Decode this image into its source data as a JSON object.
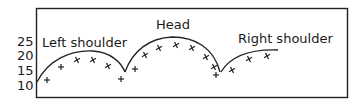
{
  "chart_data": {
    "type": "line",
    "title": "",
    "xlabel": "",
    "ylabel": "",
    "ylim": [
      10,
      25
    ],
    "yticks": [
      "25",
      "20",
      "15",
      "10"
    ],
    "grid": false,
    "legend": "none",
    "annotations": [
      {
        "text": "Left shoulder",
        "x": 42,
        "y": 46
      },
      {
        "text": "Head",
        "x": 156,
        "y": 28
      },
      {
        "text": "Right shoulder",
        "x": 238,
        "y": 42
      }
    ],
    "curves": [
      {
        "name": "Left shoulder",
        "points": [
          [
            37,
            82
          ],
          [
            60,
            57
          ],
          [
            90,
            51
          ],
          [
            112,
            58
          ],
          [
            125,
            72
          ]
        ]
      },
      {
        "name": "Head",
        "points": [
          [
            125,
            72
          ],
          [
            143,
            45
          ],
          [
            172,
            37
          ],
          [
            205,
            44
          ],
          [
            220,
            72
          ]
        ]
      },
      {
        "name": "Right shoulder",
        "points": [
          [
            222,
            72
          ],
          [
            240,
            55
          ],
          [
            260,
            49
          ],
          [
            278,
            50
          ]
        ]
      }
    ],
    "series": [
      {
        "name": "price-markers",
        "marker": "+/x",
        "points": [
          [
            47,
            80
          ],
          [
            61,
            67
          ],
          [
            77,
            60
          ],
          [
            93,
            60
          ],
          [
            108,
            66
          ],
          [
            121,
            79
          ],
          [
            135,
            69
          ],
          [
            145,
            55
          ],
          [
            159,
            48
          ],
          [
            176,
            45
          ],
          [
            192,
            48
          ],
          [
            206,
            57
          ],
          [
            214,
            67
          ],
          [
            216,
            75
          ],
          [
            232,
            70
          ],
          [
            249,
            59
          ],
          [
            267,
            56
          ]
        ]
      }
    ]
  },
  "labels": {
    "left_shoulder": "Left shoulder",
    "head": "Head",
    "right_shoulder": "Right shoulder"
  },
  "axis": {
    "y25": "25",
    "y20": "20",
    "y15": "15",
    "y10": "10"
  }
}
